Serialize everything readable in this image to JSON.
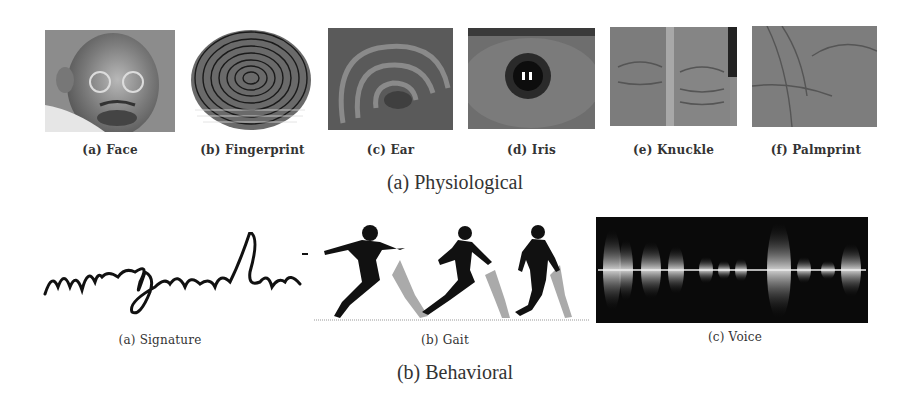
{
  "figure": {
    "physiological": {
      "caption": "(a) Physiological",
      "panels": [
        {
          "id": "face",
          "label": "(a) Face",
          "icon": "face-photo"
        },
        {
          "id": "fingerprint",
          "label": "(b) Fingerprint",
          "icon": "fingerprint-image"
        },
        {
          "id": "ear",
          "label": "(c) Ear",
          "icon": "ear-photo"
        },
        {
          "id": "iris",
          "label": "(d) Iris",
          "icon": "iris-photo"
        },
        {
          "id": "knuckle",
          "label": "(e) Knuckle",
          "icon": "knuckle-photo"
        },
        {
          "id": "palmprint",
          "label": "(f) Palmprint",
          "icon": "palmprint-photo"
        }
      ]
    },
    "behavioral": {
      "caption": "(b) Behavioral",
      "panels": [
        {
          "id": "signature",
          "label": "(a) Signature",
          "icon": "signature-image"
        },
        {
          "id": "gait",
          "label": "(b) Gait",
          "icon": "gait-silhouettes"
        },
        {
          "id": "voice",
          "label": "(c) Voice",
          "icon": "voice-waveform"
        }
      ]
    }
  }
}
